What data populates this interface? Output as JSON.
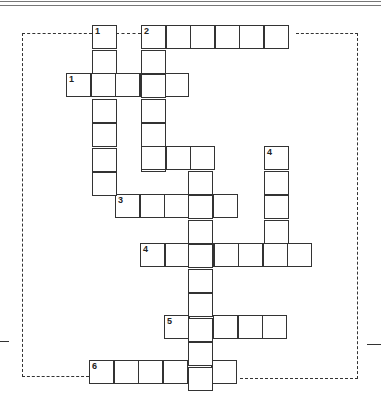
{
  "puzzle": {
    "type": "crossword",
    "cell_size": 24.5,
    "colors": {
      "line": "#333333",
      "background": "#ffffff"
    },
    "entries": [
      {
        "id": "1-across",
        "number": "1",
        "direction": "across",
        "x": 66,
        "y": 73,
        "length": 5
      },
      {
        "id": "2-across",
        "number": "2",
        "direction": "across",
        "x": 141,
        "y": 25,
        "length": 6
      },
      {
        "id": "3-across",
        "number": "3",
        "direction": "across",
        "x": 115,
        "y": 194,
        "length": 5
      },
      {
        "id": "4-across",
        "number": "4",
        "direction": "across",
        "x": 140,
        "y": 243,
        "length": 7
      },
      {
        "id": "5-across",
        "number": "5",
        "direction": "across",
        "x": 164,
        "y": 315,
        "length": 5
      },
      {
        "id": "6-across",
        "number": "6",
        "direction": "across",
        "x": 89,
        "y": 360,
        "length": 6
      },
      {
        "id": "1-down",
        "number": "1",
        "direction": "down",
        "x": 92,
        "y": 25,
        "length": 7
      },
      {
        "id": "2-down",
        "number": "",
        "direction": "down",
        "x": 141,
        "y": 25,
        "length": 6
      },
      {
        "id": "3-down",
        "number": "3",
        "direction": "down",
        "x": 188,
        "y": 146,
        "length": 10
      },
      {
        "id": "4-down",
        "number": "4",
        "direction": "down",
        "x": 264,
        "y": 146,
        "length": 5
      },
      {
        "id": "link-row",
        "number": "",
        "direction": "across",
        "x": 141,
        "y": 146,
        "length": 3
      }
    ]
  }
}
